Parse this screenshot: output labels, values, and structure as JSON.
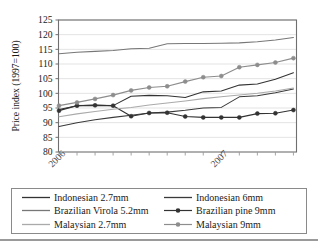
{
  "chart_data": {
    "type": "line",
    "title": "",
    "xlabel": "",
    "ylabel": "Price index (1997=100)",
    "ylim": [
      80,
      125
    ],
    "ytick_step": 5,
    "yticks": [
      80,
      85,
      90,
      95,
      100,
      105,
      110,
      115,
      120,
      125
    ],
    "grid": true,
    "grid_orientation": "horizontal",
    "legend_position": "below-plot",
    "legend_columns": 2,
    "x_tick_labels": [
      "2006",
      "2007"
    ],
    "x_tick_label_rotation": -45,
    "x_tick_label_positions": [
      0,
      9
    ],
    "x_points": 14,
    "x": [
      0,
      1,
      2,
      3,
      4,
      5,
      6,
      7,
      8,
      9,
      10,
      11,
      12,
      13
    ],
    "series": [
      {
        "name": "Indonesian 2.7mm",
        "color": "#333333",
        "marker": "none",
        "values": [
          94.5,
          95.8,
          96.0,
          95.8,
          99.0,
          99.3,
          99.2,
          98.6,
          100.5,
          100.8,
          102.8,
          103.2,
          104.8,
          107.0
        ]
      },
      {
        "name": "Indonesian 6mm",
        "color": "#3a3a3a",
        "marker": "none",
        "values": [
          88.7,
          90.0,
          91.0,
          91.8,
          92.5,
          93.3,
          93.6,
          94.2,
          95.0,
          95.2,
          98.8,
          99.2,
          100.2,
          101.5
        ]
      },
      {
        "name": "Brazilian Virola 5.2mm",
        "color": "#777777",
        "marker": "none",
        "values": [
          113.5,
          114.0,
          114.3,
          114.6,
          115.2,
          115.4,
          116.9,
          117.0,
          117.0,
          117.1,
          117.2,
          117.6,
          118.2,
          119.0
        ]
      },
      {
        "name": "Brazilian pine 9mm",
        "color": "#333333",
        "marker": "circle",
        "values": [
          94.1,
          95.8,
          95.9,
          95.8,
          92.2,
          93.3,
          93.4,
          92.1,
          91.8,
          91.8,
          91.8,
          93.1,
          93.2,
          94.3
        ]
      },
      {
        "name": "Malaysian 2.7mm",
        "color": "#aaaaaa",
        "marker": "none",
        "values": [
          92.0,
          93.0,
          93.8,
          94.6,
          95.2,
          96.0,
          96.7,
          97.4,
          98.2,
          98.8,
          99.4,
          100.0,
          100.8,
          101.8
        ]
      },
      {
        "name": "Malaysian 9mm",
        "color": "#8d8d8d",
        "marker": "circle",
        "values": [
          95.8,
          96.9,
          98.1,
          99.4,
          101.0,
          102.0,
          102.4,
          104.0,
          105.5,
          105.9,
          108.9,
          109.7,
          110.5,
          112.0
        ]
      }
    ]
  },
  "legend": {
    "entries": [
      {
        "label": "Indonesian 2.7mm",
        "color": "#333333",
        "marker": "none"
      },
      {
        "label": "Indonesian 6mm",
        "color": "#3a3a3a",
        "marker": "none"
      },
      {
        "label": "Brazilian Virola 5.2mm",
        "color": "#777777",
        "marker": "none"
      },
      {
        "label": "Brazilian pine 9mm",
        "color": "#333333",
        "marker": "circle"
      },
      {
        "label": "Malaysian 2.7mm",
        "color": "#aaaaaa",
        "marker": "none"
      },
      {
        "label": "Malaysian 9mm",
        "color": "#8d8d8d",
        "marker": "circle"
      }
    ]
  },
  "axes": {
    "frame_color": "#6f6f6f",
    "grid_color": "#dcdcdc"
  }
}
